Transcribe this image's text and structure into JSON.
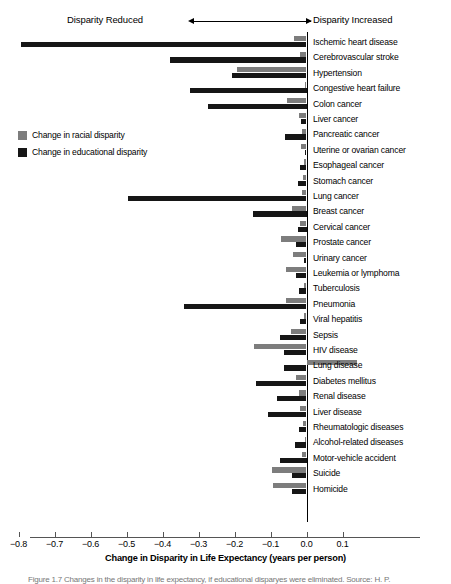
{
  "annotations": {
    "left_label": "Disparity Reduced",
    "right_label": "Disparity Increased"
  },
  "legend": {
    "items": [
      {
        "label": "Change in racial disparity",
        "color": "#7d7d7d"
      },
      {
        "label": "Change in educational disparity",
        "color": "#161616"
      }
    ]
  },
  "axis": {
    "xlabel": "Change in Disparity in Life Expectancy (years per person)",
    "ticks": [
      "−0.8",
      "−0.7",
      "−0.6",
      "−0.5",
      "−0.4",
      "−0.3",
      "−0.2",
      "−0.1",
      "0.0",
      "0.1"
    ]
  },
  "caption": {
    "text": "Figure 1.7 Changes in the disparity in life expectancy, if educational disparyes were eliminated. Source: H. P."
  },
  "chart_data": {
    "type": "bar",
    "orientation": "horizontal",
    "title": "",
    "xlabel": "Change in Disparity in Life Expectancy (years per person)",
    "ylabel": "",
    "xlim": [
      -0.85,
      0.15
    ],
    "xticks": [
      -0.8,
      -0.7,
      -0.6,
      -0.5,
      -0.4,
      -0.3,
      -0.2,
      -0.1,
      0.0,
      0.1
    ],
    "grid": false,
    "legend_position": "left-middle",
    "zero_reference_line": 0.0,
    "categories": [
      "Ischemic heart disease",
      "Cerebrovascular stroke",
      "Hypertension",
      "Congestive heart failure",
      "Colon cancer",
      "Liver cancer",
      "Pancreatic cancer",
      "Uterine or ovarian cancer",
      "Esophageal cancer",
      "Stomach cancer",
      "Lung cancer",
      "Breast cancer",
      "Cervical cancer",
      "Prostate cancer",
      "Urinary cancer",
      "Leukemia or lymphoma",
      "Tuberculosis",
      "Pneumonia",
      "Viral hepatitis",
      "Sepsis",
      "HIV disease",
      "Lung disease",
      "Diabetes mellitus",
      "Renal disease",
      "Liver disease",
      "Rheumatologic diseases",
      "Alcohol-related diseases",
      "Motor-vehicle accident",
      "Suicide",
      "Homicide"
    ],
    "series": [
      {
        "name": "Change in racial disparity",
        "color": "#7d7d7d",
        "values": [
          -0.034,
          -0.017,
          -0.192,
          -0.004,
          -0.054,
          -0.021,
          -0.012,
          -0.014,
          -0.008,
          -0.009,
          -0.012,
          -0.04,
          -0.019,
          -0.072,
          -0.037,
          -0.056,
          -0.007,
          -0.056,
          -0.008,
          -0.044,
          -0.145,
          0.14,
          -0.03,
          -0.022,
          -0.018,
          -0.011,
          -0.004,
          -0.013,
          -0.095,
          -0.094
        ]
      },
      {
        "name": "Change in educational disparity",
        "color": "#161616",
        "values": [
          -0.792,
          -0.38,
          -0.208,
          -0.325,
          -0.275,
          -0.016,
          -0.061,
          -0.005,
          -0.019,
          -0.024,
          -0.497,
          -0.15,
          -0.025,
          -0.028,
          -0.007,
          -0.028,
          -0.02,
          -0.34,
          -0.017,
          -0.073,
          -0.062,
          -0.062,
          -0.14,
          -0.082,
          -0.108,
          -0.022,
          -0.031,
          -0.075,
          -0.041,
          -0.04
        ]
      }
    ]
  }
}
